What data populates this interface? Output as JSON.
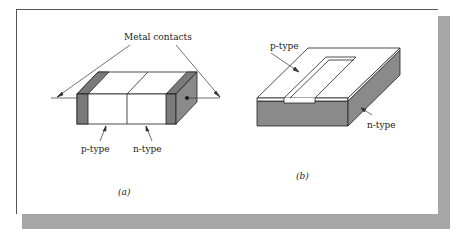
{
  "figure": {
    "panel_a": {
      "caption": "(a)",
      "callout": "Metal contacts",
      "labels": {
        "p_region": "p-type",
        "n_region": "n-type"
      }
    },
    "panel_b": {
      "caption": "(b)",
      "labels": {
        "top_layer": "p-type",
        "substrate": "n-type"
      }
    }
  },
  "colors": {
    "metal_fill": "#7a7a7a",
    "substrate_fill": "#8a8a8a",
    "outline": "#222222",
    "frame_shadow": "#a6a6a6"
  }
}
